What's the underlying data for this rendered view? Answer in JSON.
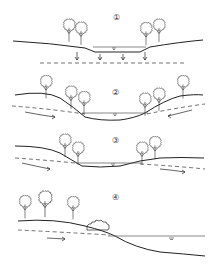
{
  "diagram": {
    "title": "",
    "panels": [
      {
        "id": 1,
        "label": "①",
        "description": "Water table below channel; water seeps downward (losing stream)"
      },
      {
        "id": 2,
        "label": "②",
        "description": "Groundwater flows into channel from both banks (gaining stream)"
      },
      {
        "id": 3,
        "label": "③",
        "description": "Groundwater flows in from one side and out the other (flow-through)"
      },
      {
        "id": 4,
        "label": "④",
        "description": "Bank slopes down to water with shrub; groundwater flows toward water body"
      }
    ],
    "colors": {
      "line": "#222222",
      "background": "#ffffff"
    }
  }
}
